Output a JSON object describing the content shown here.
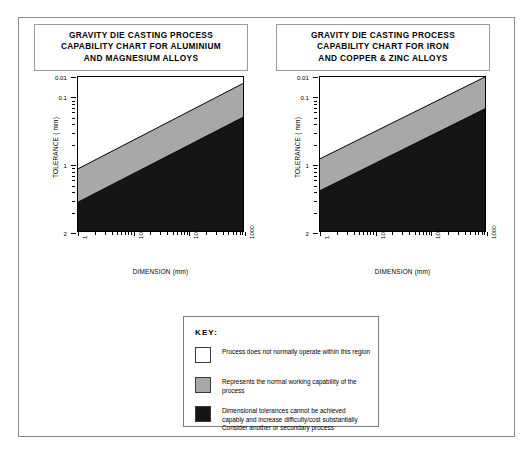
{
  "charts": [
    {
      "id": "aluminium-magnesium",
      "title_lines": [
        "GRAVITY DIE CASTING PROCESS",
        "CAPABILITY CHART FOR ALUMINIUM",
        "AND MAGNESIUM ALLOYS"
      ],
      "xlabel": "DIMENSION (mm)",
      "ylabel": "TOLERANCE ( mm)",
      "yticks": [
        "2",
        "1",
        "0.1",
        "0.01"
      ],
      "xticks": [
        "1",
        "10",
        "100",
        "1000"
      ]
    },
    {
      "id": "iron-copper-zinc",
      "title_lines": [
        "GRAVITY DIE CASTING PROCESS",
        "CAPABILITY CHART FOR IRON",
        "AND COPPER & ZINC ALLOYS"
      ],
      "xlabel": "DIMENSION (mm)",
      "ylabel": "TOLERANCE ( mm)",
      "yticks": [
        "2",
        "1",
        "0.1",
        "0.01"
      ],
      "xticks": [
        "1",
        "10",
        "100",
        "1000"
      ]
    }
  ],
  "key": {
    "heading": "KEY:",
    "items": [
      {
        "swatch": "white",
        "color": "#ffffff",
        "lines": [
          "Process does not normally operate within this region"
        ]
      },
      {
        "swatch": "grey",
        "color": "#a8a8a8",
        "lines": [
          "Represents the normal working capability of the",
          "process"
        ]
      },
      {
        "swatch": "black",
        "color": "#151515",
        "lines": [
          "Dimensional tolerances cannot be achieved",
          "capably and increase difficulty/cost substantially",
          "Consider another or secondary process"
        ]
      }
    ]
  },
  "colors": {
    "grey_band": "#a8a8a8",
    "black_band": "#151515",
    "frame": "#8a8a8a"
  },
  "chart_data": [
    {
      "type": "area",
      "title": "GRAVITY DIE CASTING PROCESS CAPABILITY CHART FOR ALUMINIUM AND MAGNESIUM ALLOYS",
      "xlabel": "DIMENSION (mm)",
      "ylabel": "TOLERANCE ( mm)",
      "xscale": "log",
      "yscale": "log",
      "xlim": [
        1,
        1000
      ],
      "ylim": [
        0.01,
        2
      ],
      "xticks": [
        1,
        10,
        100,
        1000
      ],
      "yticks": [
        0.01,
        0.1,
        1,
        2
      ],
      "grid": false,
      "legend": "below-charts",
      "series": [
        {
          "name": "Upper boundary (normal capability top)",
          "x": [
            1,
            1000
          ],
          "y": [
            0.085,
            1.6
          ]
        },
        {
          "name": "Lower boundary (normal capability bottom)",
          "x": [
            1,
            1000
          ],
          "y": [
            0.027,
            0.5
          ]
        }
      ],
      "regions": [
        {
          "name": "Process does not normally operate within this region",
          "fill": "#ffffff",
          "position": "above upper boundary"
        },
        {
          "name": "Represents the normal working capability of the process",
          "fill": "#a8a8a8",
          "position": "between boundaries"
        },
        {
          "name": "Dimensional tolerances cannot be achieved capably",
          "fill": "#151515",
          "position": "below lower boundary"
        }
      ]
    },
    {
      "type": "area",
      "title": "GRAVITY DIE CASTING PROCESS CAPABILITY CHART FOR IRON AND COPPER & ZINC ALLOYS",
      "xlabel": "DIMENSION (mm)",
      "ylabel": "TOLERANCE ( mm)",
      "xscale": "log",
      "yscale": "log",
      "xlim": [
        1,
        1000
      ],
      "ylim": [
        0.01,
        2
      ],
      "xticks": [
        1,
        10,
        100,
        1000
      ],
      "yticks": [
        0.01,
        0.1,
        1,
        2
      ],
      "grid": false,
      "legend": "below-charts",
      "series": [
        {
          "name": "Upper boundary (normal capability top)",
          "x": [
            1,
            1000
          ],
          "y": [
            0.12,
            2.0
          ]
        },
        {
          "name": "Lower boundary (normal capability bottom)",
          "x": [
            1,
            1000
          ],
          "y": [
            0.04,
            0.67
          ]
        }
      ],
      "regions": [
        {
          "name": "Process does not normally operate within this region",
          "fill": "#ffffff",
          "position": "above upper boundary"
        },
        {
          "name": "Represents the normal working capability of the process",
          "fill": "#a8a8a8",
          "position": "between boundaries"
        },
        {
          "name": "Dimensional tolerances cannot be achieved capably",
          "fill": "#151515",
          "position": "below lower boundary"
        }
      ]
    }
  ]
}
